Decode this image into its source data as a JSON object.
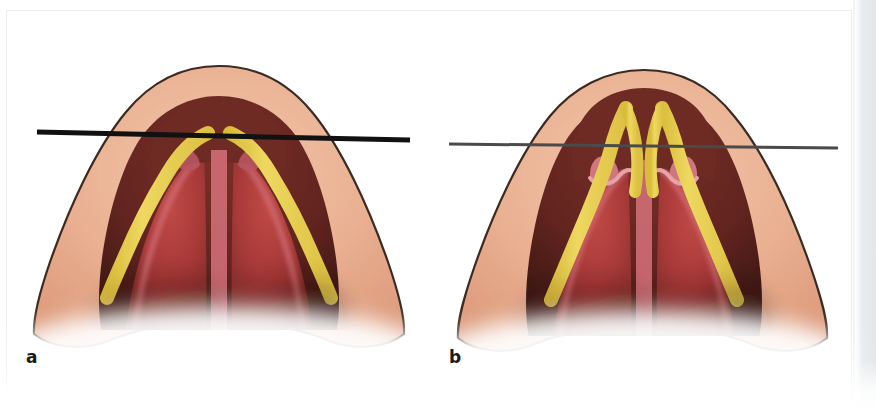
{
  "figure": {
    "type": "anatomical-illustration",
    "panel_count": 2,
    "background_color": "#ffffff",
    "page_border_color": "#ededed",
    "gutter_color": "#e4e7ea"
  },
  "palette": {
    "skin_light": "#f0bda4",
    "skin_mid": "#e4a184",
    "skin_deep": "#d08d72",
    "outline": "#3b2a22",
    "mucosa_red": "#b33a3c",
    "mucosa_deep": "#7e2a26",
    "vestibule_dark": "#5e2420",
    "dome_maroon": "#6e2b24",
    "pink_rim": "#d4717a",
    "pink_light": "#e59aa0",
    "cartilage_yellow": "#ead14e",
    "cartilage_yellow_edge": "#d9bc3a",
    "line_a": "#111111",
    "line_b": "#4a4a4a",
    "label_color": "#1b1b1b",
    "shadow": "#3a1f1a"
  },
  "panels": [
    {
      "id": "a",
      "label": "a",
      "caption_letter": "a",
      "reference_line": {
        "name": "horizontal-reference-line-a",
        "style": "thick-black",
        "color": "#111111",
        "thickness_px": 5,
        "x1": 37,
        "y1": 132,
        "x2": 410,
        "y2": 140,
        "description": "thick black horizontal line crossing the nasal tip at the dome level"
      },
      "dome_description": "domes sit at/below the reference line; yellow medial crura stop at the line",
      "features": [
        "lateral crus band left",
        "lateral crus band right",
        "medial crura / columella strip",
        "dome notch left",
        "dome notch right",
        "soft triangle shadow"
      ]
    },
    {
      "id": "b",
      "label": "b",
      "caption_letter": "b",
      "reference_line": {
        "name": "horizontal-reference-line-b",
        "style": "thin-gray",
        "color": "#4a4a4a",
        "thickness_px": 3,
        "x1": 11,
        "y1": 144,
        "x2": 400,
        "y2": 148,
        "description": "thin dark-gray horizontal line crossing the nasal tip below the projected domes"
      },
      "dome_description": "domes project above the reference line; yellow arches rise over the line with scalloped pink notches beneath",
      "features": [
        "lateral crus band left",
        "lateral crus band right",
        "medial crura / columella strip",
        "scalloped notch left",
        "scalloped notch right",
        "raised dome arch left",
        "raised dome arch right"
      ]
    }
  ]
}
